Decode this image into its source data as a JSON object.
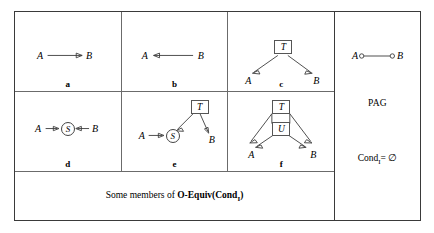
{
  "figure": {
    "caption_prefix": "Some members of ",
    "caption_bold": "O-Equiv(Cond",
    "caption_sub": "I",
    "caption_bold_end": ")"
  },
  "panels": [
    {
      "id": "a",
      "label": "a",
      "nodes": [
        {
          "name": "A",
          "type": "letter"
        },
        {
          "name": "B",
          "type": "letter"
        }
      ],
      "edges": [
        {
          "from": "A",
          "to": "B",
          "kind": "arrow-right"
        }
      ]
    },
    {
      "id": "b",
      "label": "b",
      "nodes": [
        {
          "name": "A",
          "type": "letter"
        },
        {
          "name": "B",
          "type": "letter"
        }
      ],
      "edges": [
        {
          "from": "B",
          "to": "A",
          "kind": "arrow-left"
        }
      ]
    },
    {
      "id": "c",
      "label": "c",
      "nodes": [
        {
          "name": "T",
          "type": "box"
        },
        {
          "name": "A",
          "type": "letter"
        },
        {
          "name": "B",
          "type": "letter"
        }
      ],
      "edges": [
        {
          "from": "T",
          "to": "A",
          "kind": "arrow"
        },
        {
          "from": "T",
          "to": "B",
          "kind": "arrow"
        }
      ]
    },
    {
      "id": "d",
      "label": "d",
      "nodes": [
        {
          "name": "A",
          "type": "letter"
        },
        {
          "name": "S",
          "type": "circle"
        },
        {
          "name": "B",
          "type": "letter"
        }
      ],
      "edges": [
        {
          "from": "A",
          "to": "S",
          "kind": "arrow-right"
        },
        {
          "from": "B",
          "to": "S",
          "kind": "arrow-left"
        }
      ]
    },
    {
      "id": "e",
      "label": "e",
      "nodes": [
        {
          "name": "T",
          "type": "box"
        },
        {
          "name": "A",
          "type": "letter"
        },
        {
          "name": "S",
          "type": "circle"
        },
        {
          "name": "B",
          "type": "letter"
        }
      ],
      "edges": [
        {
          "from": "A",
          "to": "S",
          "kind": "arrow-right"
        },
        {
          "from": "T",
          "to": "S",
          "kind": "arrow"
        },
        {
          "from": "T",
          "to": "B",
          "kind": "arrow"
        }
      ]
    },
    {
      "id": "f",
      "label": "f",
      "nodes": [
        {
          "name": "T",
          "type": "box"
        },
        {
          "name": "U",
          "type": "box"
        },
        {
          "name": "A",
          "type": "letter"
        },
        {
          "name": "B",
          "type": "letter"
        }
      ],
      "edges": [
        {
          "from": "T",
          "to": "A",
          "kind": "arrow"
        },
        {
          "from": "T",
          "to": "B",
          "kind": "arrow"
        },
        {
          "from": "U",
          "to": "A",
          "kind": "arrow"
        },
        {
          "from": "U",
          "to": "B",
          "kind": "arrow"
        }
      ]
    }
  ],
  "pag": {
    "title": "PAG",
    "cond_label": "Cond",
    "cond_sub": "I",
    "cond_value": "= ∅",
    "node_a": "A",
    "node_b": "B",
    "edge_kind": "circle-circle"
  },
  "colors": {
    "stroke": "#3b3b3b",
    "frame": "#3a3a3a",
    "divider": "#6b6b6b",
    "background": "#ffffff"
  }
}
